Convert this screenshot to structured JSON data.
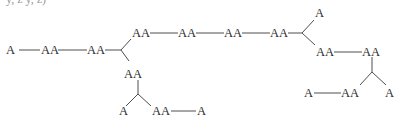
{
  "diagram": {
    "type": "tree",
    "top_clipped_text": "y, z y, z)",
    "nodes": [
      {
        "id": "n1",
        "label": "A",
        "x": 12,
        "y": 54
      },
      {
        "id": "n2",
        "label": "AA",
        "x": 49,
        "y": 54
      },
      {
        "id": "n3",
        "label": "AA",
        "x": 96,
        "y": 54
      },
      {
        "id": "n4",
        "label": "AA",
        "x": 141,
        "y": 37
      },
      {
        "id": "n5",
        "label": "AA",
        "x": 187,
        "y": 37
      },
      {
        "id": "n6",
        "label": "AA",
        "x": 233,
        "y": 37
      },
      {
        "id": "n7",
        "label": "AA",
        "x": 279,
        "y": 37
      },
      {
        "id": "n8",
        "label": "A",
        "x": 321,
        "y": 17
      },
      {
        "id": "n9",
        "label": "AA",
        "x": 325,
        "y": 56
      },
      {
        "id": "n10",
        "label": "AA",
        "x": 371,
        "y": 56
      },
      {
        "id": "n11",
        "label": "A",
        "x": 389,
        "y": 97
      },
      {
        "id": "n12",
        "label": "AA",
        "x": 350,
        "y": 97
      },
      {
        "id": "n13",
        "label": "A",
        "x": 308,
        "y": 97
      },
      {
        "id": "n14",
        "label": "AA",
        "x": 133,
        "y": 78
      },
      {
        "id": "n15",
        "label": "A",
        "x": 123,
        "y": 115
      },
      {
        "id": "n16",
        "label": "AA",
        "x": 161,
        "y": 115
      },
      {
        "id": "n17",
        "label": "A",
        "x": 201,
        "y": 115
      }
    ],
    "labels": {
      "A": "A",
      "AA": "AA"
    }
  }
}
